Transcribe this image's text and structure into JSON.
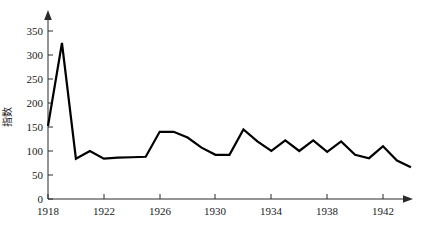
{
  "chart_data": {
    "type": "line",
    "title": "",
    "subtitle": "",
    "xlabel": "",
    "ylabel": "指数",
    "xlim": [
      1918,
      1944
    ],
    "ylim": [
      0,
      375
    ],
    "ytick_values": [
      0,
      50,
      100,
      150,
      200,
      250,
      300,
      350
    ],
    "ytick_labels": [
      "0",
      "50",
      "100",
      "150",
      "200",
      "250",
      "300",
      "350"
    ],
    "xtick_values": [
      1918,
      1922,
      1926,
      1930,
      1934,
      1938,
      1942
    ],
    "xtick_labels": [
      "1918",
      "1922",
      "1926",
      "1930",
      "1934",
      "1938",
      "1942"
    ],
    "grid": false,
    "legend": false,
    "legend_position": "none",
    "line_color": "#000000",
    "x": [
      1918,
      1919,
      1920,
      1921,
      1922,
      1923,
      1924,
      1925,
      1926,
      1927,
      1928,
      1929,
      1930,
      1931,
      1932,
      1933,
      1934,
      1935,
      1936,
      1937,
      1938,
      1939,
      1940,
      1941,
      1942,
      1943,
      1944
    ],
    "series": [
      {
        "name": "指数",
        "values": [
          152,
          325,
          84,
          100,
          84,
          86,
          87,
          88,
          140,
          140,
          128,
          107,
          92,
          92,
          145,
          120,
          100,
          122,
          100,
          122,
          98,
          120,
          92,
          85,
          110,
          80,
          66
        ]
      }
    ]
  },
  "axes": {
    "y_axis_arrow": "up-arrow",
    "x_axis_arrow": "right-arrow"
  }
}
